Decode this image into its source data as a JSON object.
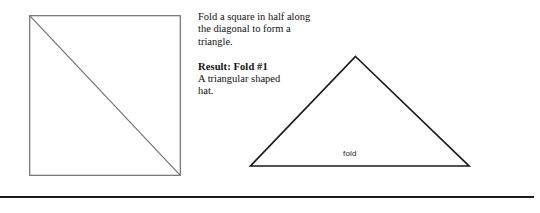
{
  "page": {
    "background_color": "#ffffff",
    "width": 540,
    "height": 213
  },
  "instructions": {
    "step_text": "Fold a square in half along\nthe diagonal to form a\ntriangle.",
    "result_heading": "Result:  Fold #1",
    "result_text": "A triangular shaped\nhat."
  },
  "figures": {
    "square": {
      "name": "square-with-diagonal",
      "stroke_color": "#6e6e6e",
      "fill_color": "#ffffff",
      "stroke_width": 1
    },
    "triangle": {
      "name": "folded-triangle",
      "stroke_color": "#1b1b1b",
      "fill_color": "#ffffff",
      "stroke_width": 1.6,
      "base_label": "fold"
    }
  },
  "divider": {
    "color": "#1b1b1b",
    "thickness": 2
  }
}
